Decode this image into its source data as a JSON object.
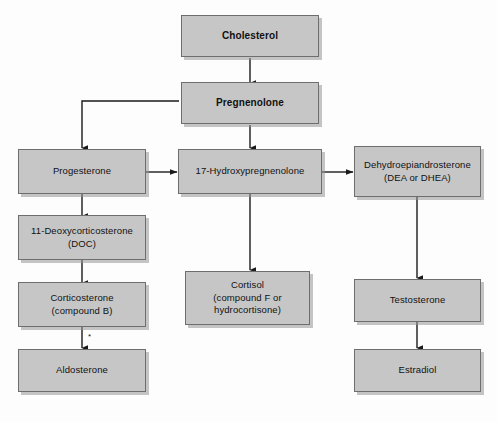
{
  "figure": {
    "background_color": "#fdfdfd",
    "node_fill_color": "#c6c6c6",
    "node_border_color": "#6e6e6e",
    "connector_color": "#1a1a1a"
  },
  "nodes": [
    {
      "id": "cholesterol",
      "label": "Cholesterol",
      "bold": true
    },
    {
      "id": "pregnenolone",
      "label": "Pregnenolone",
      "bold": true
    },
    {
      "id": "progesterone",
      "label": "Progesterone",
      "bold": false
    },
    {
      "id": "hydroxypreg",
      "label": "17-Hydroxypregnenolone",
      "bold": false
    },
    {
      "id": "dhea",
      "label": "Dehydroepiandrosterone\n(DEA or DHEA)",
      "bold": false
    },
    {
      "id": "doc",
      "label": "11-Deoxycorticosterone\n(DOC)",
      "bold": false
    },
    {
      "id": "corticosterone",
      "label": "Corticosterone\n(compound B)",
      "bold": false
    },
    {
      "id": "cortisol",
      "label": "Cortisol\n(compound F or\nhydrocortisone)",
      "bold": false
    },
    {
      "id": "testosterone",
      "label": "Testosterone",
      "bold": false
    },
    {
      "id": "aldosterone",
      "label": "Aldosterone",
      "bold": false
    },
    {
      "id": "estradiol",
      "label": "Estradiol",
      "bold": false
    }
  ],
  "edges": [
    {
      "from": "cholesterol",
      "to": "pregnenolone",
      "style": "straight-down"
    },
    {
      "from": "pregnenolone",
      "to": "progesterone",
      "style": "left-then-down"
    },
    {
      "from": "pregnenolone",
      "to": "hydroxypreg",
      "style": "straight-down"
    },
    {
      "from": "progesterone",
      "to": "hydroxypreg",
      "style": "straight-right"
    },
    {
      "from": "hydroxypreg",
      "to": "dhea",
      "style": "straight-right"
    },
    {
      "from": "progesterone",
      "to": "doc",
      "style": "straight-down"
    },
    {
      "from": "doc",
      "to": "corticosterone",
      "style": "straight-down"
    },
    {
      "from": "corticosterone",
      "to": "aldosterone",
      "style": "straight-down",
      "marker": "*"
    },
    {
      "from": "hydroxypreg",
      "to": "cortisol",
      "style": "straight-down"
    },
    {
      "from": "dhea",
      "to": "testosterone",
      "style": "straight-down"
    },
    {
      "from": "testosterone",
      "to": "estradiol",
      "style": "straight-down"
    }
  ],
  "annotations": {
    "aldosterone_footnote_mark": "*"
  }
}
